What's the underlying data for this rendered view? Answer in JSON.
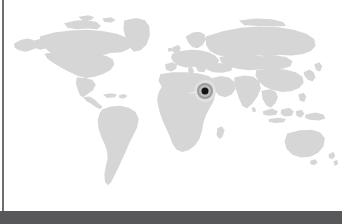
{
  "viewport": {
    "width": 342,
    "height": 224,
    "background_color": "#ffffff"
  },
  "map_panel": {
    "name": "world-map-panel",
    "background_color": "#ffffff",
    "height": 211,
    "left_rule_color": "#6e6e70"
  },
  "map": {
    "projection": "equirectangular",
    "land_color": "#d6d6d6",
    "ocean_color": "#ffffff",
    "regions_depicted": [
      "North America",
      "South America",
      "Greenland",
      "Europe",
      "Africa",
      "Asia",
      "Australia",
      "Indonesia",
      "Japan",
      "British Isles",
      "Madagascar",
      "New Zealand"
    ]
  },
  "marker": {
    "name": "location-marker",
    "type": "concentric-target",
    "x_percent": 59.9,
    "y_percent": 43.3,
    "approx_region": "Arabian Peninsula / Middle East",
    "dot_color": "#131313",
    "ring_color": "#9a9a9a",
    "inner_ring_color": "#bdbdbd",
    "halo_color": "#e2e2e2"
  },
  "bottom_band": {
    "name": "bottom-chrome-band",
    "color": "#58585a",
    "height": 13,
    "label": ""
  }
}
